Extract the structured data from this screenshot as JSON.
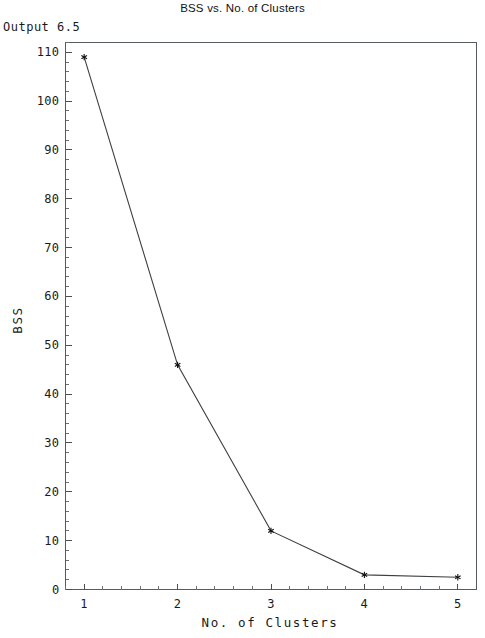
{
  "header": {
    "output_label": "Output 6.5"
  },
  "chart_data": {
    "type": "line",
    "title": "BSS vs. No. of Clusters",
    "xlabel": "No. of Clusters",
    "ylabel": "BSS",
    "x": [
      1,
      2,
      3,
      4,
      5
    ],
    "values": [
      109,
      46,
      12,
      3,
      2.5
    ],
    "series": [
      {
        "name": "BSS",
        "values": [
          109,
          46,
          12,
          3,
          2.5
        ]
      }
    ],
    "xlim": [
      0.8,
      5.2
    ],
    "ylim": [
      0,
      112
    ],
    "xticks": [
      1,
      2,
      3,
      4,
      5
    ],
    "xtick_labels": [
      "1",
      "2",
      "3",
      "4",
      "5"
    ],
    "yticks": [
      0,
      10,
      20,
      30,
      40,
      50,
      60,
      70,
      80,
      90,
      100,
      110
    ],
    "ytick_labels": [
      "0",
      "10",
      "20",
      "30",
      "40",
      "50",
      "60",
      "70",
      "80",
      "90",
      "100",
      "110"
    ],
    "minor_ticks_per_major_x": 5,
    "minor_ticks_per_major_y": 5,
    "grid": false,
    "legend": false,
    "marker": "star",
    "line_color": "#3c4043",
    "marker_color": "#111111",
    "frame_color": "#555b5e",
    "background": "#ffffff"
  }
}
